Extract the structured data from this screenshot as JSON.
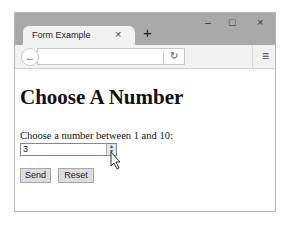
{
  "browser": {
    "tab_title": "Form Example",
    "tab_close": "×",
    "new_tab": "+",
    "window_controls": {
      "minimize": "–",
      "maximize": "□",
      "close": "×"
    },
    "back": "←",
    "address": "",
    "reload": "↻",
    "menu": "≡"
  },
  "page": {
    "heading": "Choose A Number",
    "label": "Choose a number between 1 and 10:",
    "number_value": "3",
    "spin_up": "▲",
    "spin_down": "▼",
    "send_label": "Send",
    "reset_label": "Reset"
  }
}
